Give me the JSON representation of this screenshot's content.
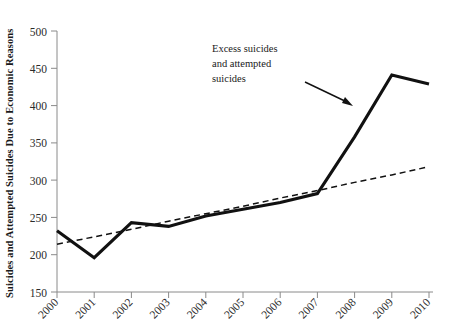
{
  "chart_data": {
    "type": "line",
    "title": "",
    "xlabel": "",
    "ylabel": "Suicides and Attempted Suicides Due to Economic Reasons",
    "categories": [
      "2000",
      "2001",
      "2002",
      "2003",
      "2004",
      "2005",
      "2006",
      "2007",
      "2008",
      "2009",
      "2010"
    ],
    "x": [
      2000,
      2001,
      2002,
      2003,
      2004,
      2005,
      2006,
      2007,
      2008,
      2009,
      2010
    ],
    "ylim": [
      150,
      500
    ],
    "xlim": [
      2000,
      2010
    ],
    "yticks": [
      150,
      200,
      250,
      300,
      350,
      400,
      450,
      500
    ],
    "ytick_labels": [
      "150",
      "200",
      "250",
      "300",
      "350",
      "400",
      "450",
      "500"
    ],
    "grid": false,
    "legend": "none",
    "series": [
      {
        "name": "Observed suicides and attempted suicides",
        "style": "solid",
        "values": [
          232,
          196,
          243,
          238,
          252,
          261,
          270,
          282,
          358,
          441,
          429
        ]
      },
      {
        "name": "Trend line",
        "style": "dashed",
        "values": [
          214,
          224,
          234,
          245,
          255,
          265,
          276,
          286,
          297,
          307,
          318
        ]
      }
    ],
    "annotations": [
      {
        "name": "excess-suicides-annotation",
        "lines": [
          "Excess suicides",
          "and attempted",
          "suicides"
        ],
        "arrow": {
          "from_x": 305,
          "from_y": 82,
          "to_x": 353,
          "to_y": 106
        }
      }
    ],
    "colors": {
      "series_line": "#111111",
      "trend_line": "#111111",
      "axis": "#8a8a8a",
      "text": "#1a1a1a",
      "background": "#ffffff"
    }
  }
}
